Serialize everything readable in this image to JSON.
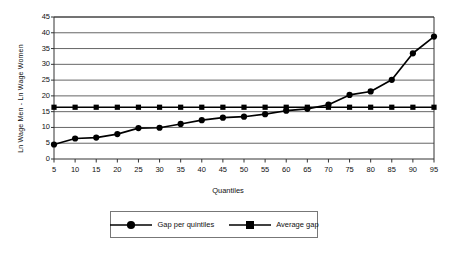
{
  "chart_data": {
    "type": "line",
    "title": "",
    "xlabel": "Quantiles",
    "ylabel": "Ln Wage Men - Ln Wage Women",
    "categories": [
      5,
      10,
      15,
      20,
      25,
      30,
      35,
      40,
      45,
      50,
      55,
      60,
      65,
      70,
      75,
      80,
      85,
      90,
      95
    ],
    "xlim": [
      5,
      95
    ],
    "ylim": [
      0,
      45
    ],
    "ytick_values": [
      0,
      5,
      10,
      15,
      20,
      25,
      30,
      35,
      40,
      45
    ],
    "xtick_values": [
      5,
      10,
      15,
      20,
      25,
      30,
      35,
      40,
      45,
      50,
      55,
      60,
      65,
      70,
      75,
      80,
      85,
      90,
      95
    ],
    "grid": "horizontal",
    "legend_position": "bottom-center",
    "series": [
      {
        "name": "Gap per quintiles",
        "marker": "circle",
        "color": "#000000",
        "values": [
          4.6,
          6.5,
          6.8,
          7.9,
          9.8,
          9.9,
          11.1,
          12.3,
          13.1,
          13.4,
          14.2,
          15.3,
          15.9,
          17.2,
          20.3,
          21.4,
          25.1,
          33.5,
          38.8
        ]
      },
      {
        "name": "Average gap",
        "marker": "square",
        "color": "#000000",
        "values": [
          16.4,
          16.4,
          16.4,
          16.4,
          16.4,
          16.4,
          16.4,
          16.4,
          16.4,
          16.4,
          16.4,
          16.4,
          16.4,
          16.4,
          16.4,
          16.4,
          16.4,
          16.4,
          16.4
        ]
      }
    ]
  },
  "legend": {
    "items": [
      {
        "label": "Gap per quintiles",
        "marker": "circle"
      },
      {
        "label": "Average gap",
        "marker": "square"
      }
    ]
  },
  "axis": {
    "x_title": "Quantiles",
    "y_title": "Ln Wage Men - Ln Wage Women"
  },
  "colors": {
    "series": "#000000",
    "grid": "#555555",
    "axis": "#333333",
    "background": "#ffffff"
  }
}
